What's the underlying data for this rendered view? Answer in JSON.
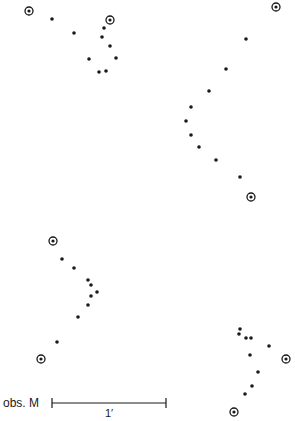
{
  "diagram": {
    "colors": {
      "ink": "#1a1a1a",
      "background": "#ffffff"
    },
    "panels": [
      {
        "name": "top-left",
        "reference_stars": [
          [
            29,
            11
          ],
          [
            110,
            20
          ]
        ],
        "points": [
          [
            52,
            19
          ],
          [
            74,
            33
          ],
          [
            104,
            28
          ],
          [
            102,
            37
          ],
          [
            110,
            46
          ],
          [
            89,
            59
          ],
          [
            116,
            58
          ],
          [
            99,
            72
          ],
          [
            106,
            71
          ]
        ]
      },
      {
        "name": "top-right",
        "reference_stars": [
          [
            276,
            7
          ],
          [
            251,
            197
          ]
        ],
        "points": [
          [
            246,
            39
          ],
          [
            226,
            69
          ],
          [
            209,
            91
          ],
          [
            191,
            107
          ],
          [
            186,
            121
          ],
          [
            191,
            135
          ],
          [
            199,
            147
          ],
          [
            216,
            160
          ],
          [
            240,
            177
          ]
        ]
      },
      {
        "name": "bottom-left",
        "reference_stars": [
          [
            53,
            241
          ],
          [
            41,
            359
          ]
        ],
        "points": [
          [
            62,
            259
          ],
          [
            74,
            268
          ],
          [
            88,
            280
          ],
          [
            91,
            285
          ],
          [
            97,
            292
          ],
          [
            91,
            296
          ],
          [
            88,
            305
          ],
          [
            78,
            317
          ],
          [
            57,
            342
          ]
        ]
      },
      {
        "name": "bottom-right",
        "reference_stars": [
          [
            286,
            359
          ],
          [
            234,
            412
          ]
        ],
        "points": [
          [
            240,
            329
          ],
          [
            239,
            334
          ],
          [
            246,
            338
          ],
          [
            251,
            338
          ],
          [
            269,
            346
          ],
          [
            250,
            355
          ],
          [
            258,
            372
          ],
          [
            252,
            386
          ],
          [
            245,
            394
          ]
        ]
      }
    ],
    "scale_bar": {
      "label": "obs. M",
      "length_label": "1′",
      "x1": 52,
      "x2": 166,
      "y": 403
    }
  }
}
